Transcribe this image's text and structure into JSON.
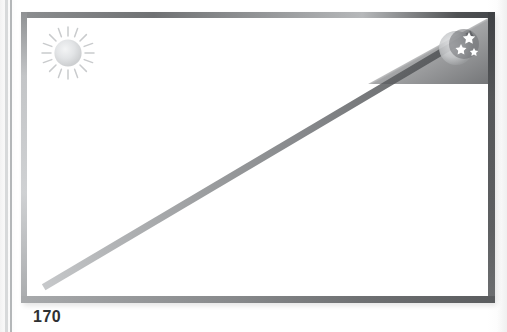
{
  "page": {
    "folio": "170",
    "background_color": "#fdfdfd",
    "gutter_line_color": "#b4b7b9"
  },
  "illustration": {
    "name": "framed-diagonal-diagram",
    "frame": {
      "border_top_color": "#8f9193",
      "border_right_color": "#5c5e60",
      "border_bottom_color": "#7e8082",
      "border_left_color": "#b2b4b6",
      "fill_color": "#ffffff"
    },
    "diagonal": {
      "label": "",
      "start": "bottom-left",
      "end": "top-right",
      "color_light": "#c6c8ca",
      "color_dark": "#55575a"
    },
    "icons": [
      {
        "name": "sun-icon",
        "label": "",
        "position": "top-left",
        "color": "#d4d6d8"
      },
      {
        "name": "moon-stars-icon",
        "label": "",
        "position": "top-right",
        "color": "#ffffff",
        "star_count": "3"
      }
    ]
  }
}
